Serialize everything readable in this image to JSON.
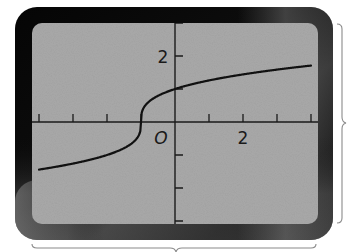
{
  "chart_data": {
    "type": "line",
    "title": "",
    "xlabel": "",
    "ylabel": "",
    "function": "y = cbrt(x + 1)",
    "xlim": [
      -4,
      4
    ],
    "ylim": [
      -3,
      3
    ],
    "x_ticks": [
      -4,
      -3,
      -2,
      -1,
      0,
      1,
      2,
      3,
      4
    ],
    "y_ticks": [
      -3,
      -2,
      -1,
      0,
      1,
      2,
      3
    ],
    "tick_labels": {
      "origin": "O",
      "x": "2",
      "y": "2"
    },
    "grid": false,
    "legend": null,
    "series": [
      {
        "name": "curve",
        "x": [
          -4,
          -3,
          -2,
          -1.5,
          -1.1,
          -1,
          -0.9,
          -0.5,
          0,
          1,
          2,
          3,
          4
        ],
        "y": [
          -1.44,
          -1.26,
          -1.0,
          -0.79,
          -0.46,
          0.0,
          0.46,
          0.79,
          1.0,
          1.26,
          1.44,
          1.59,
          1.71
        ]
      }
    ]
  },
  "screen": {
    "background": "#a9a9a9",
    "bezel_color": "#0a0a0a",
    "curve_color": "#111111"
  },
  "labels": {
    "origin": "O",
    "x_two": "2",
    "y_two": "2"
  }
}
